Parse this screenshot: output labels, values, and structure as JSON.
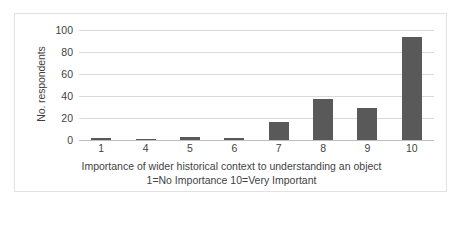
{
  "chart_data": {
    "type": "bar",
    "title": "",
    "subtitle": "",
    "categories": [
      "1",
      "4",
      "5",
      "6",
      "7",
      "8",
      "9",
      "10"
    ],
    "values": [
      2,
      1,
      3,
      2,
      16,
      37,
      29,
      94
    ],
    "series": [
      {
        "name": "No. respondents",
        "values": [
          2,
          1,
          3,
          2,
          16,
          37,
          29,
          94
        ]
      }
    ],
    "xlabel": "Importance of wider historical context to understanding an object 1=No Importance 10=Very Important",
    "ylabel": "No. respondents",
    "ylim": [
      0,
      100
    ],
    "yticks": [
      0,
      20,
      40,
      60,
      80,
      100
    ],
    "ytick_labels": [
      "0",
      "20",
      "40",
      "60",
      "80",
      "100"
    ],
    "grid": true,
    "grid_axis": "y",
    "legend": false,
    "legend_position": "none",
    "bar_color": "#595959",
    "gridline_color": "#D9D9D9",
    "frame_color": "#E2E2E2"
  },
  "axes": {
    "y_title": "No. respondents",
    "x_title_line1": "Importance of wider historical context to understanding an object",
    "x_title_line2": "1=No Importance 10=Very Important"
  },
  "caption": {
    "text": ""
  }
}
